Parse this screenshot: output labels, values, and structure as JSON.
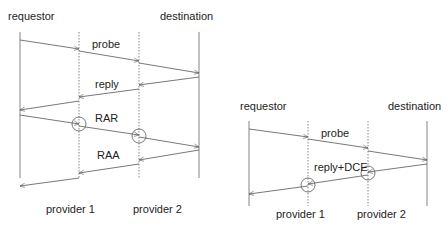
{
  "diagrams": [
    {
      "id": "left",
      "labels": {
        "requestor": "requestor",
        "destination": "destination",
        "provider1": "provider 1",
        "provider2": "provider 2"
      },
      "messages": {
        "probe": "probe",
        "reply": "reply",
        "rar": "RAR",
        "raa": "RAA"
      }
    },
    {
      "id": "right",
      "labels": {
        "requestor": "requestor",
        "destination": "destination",
        "provider1": "provider 1",
        "provider2": "provider 2"
      },
      "messages": {
        "probe": "probe",
        "reply_dce": "reply+DCE"
      }
    }
  ],
  "colors": {
    "line": "#555555",
    "text": "#222222"
  }
}
